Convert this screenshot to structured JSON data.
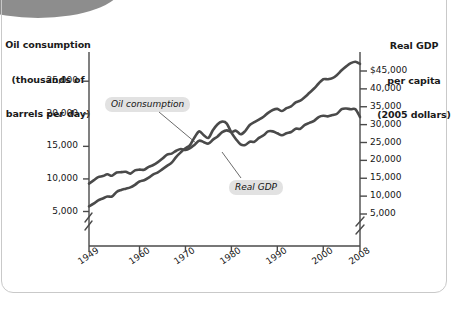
{
  "chart_data": {
    "type": "line",
    "title": "",
    "xlabel": "Year",
    "grid": false,
    "legend_position": "inline-annotations",
    "x_axis": {
      "label": "Year",
      "ticks": [
        1949,
        1960,
        1970,
        1980,
        1990,
        2000,
        2008
      ],
      "tick_labels": [
        "1949",
        "1960",
        "1970",
        "1980",
        "1990",
        "2000",
        "2008"
      ],
      "range": [
        1949,
        2008
      ]
    },
    "left_axis": {
      "title": "Oil consumption\n(thousands of\nbarrels per day)",
      "title_line1": "Oil consumption",
      "title_line2": "(thousands of",
      "title_line3": "barrels per day)",
      "ticks": [
        5000,
        10000,
        15000,
        20000,
        25000
      ],
      "tick_labels": [
        "5,000",
        "10,000",
        "15,000",
        "20,000",
        "25,000"
      ],
      "range": [
        0,
        27000
      ],
      "axis_break": true
    },
    "right_axis": {
      "title": "Real GDP\nper capita\n(2005 dollars)",
      "title_line1": "Real GDP",
      "title_line2": "per capita",
      "title_line3": "(2005 dollars)",
      "ticks": [
        5000,
        10000,
        15000,
        20000,
        25000,
        30000,
        35000,
        40000,
        45000
      ],
      "tick_labels": [
        "5,000",
        "10,000",
        "15,000",
        "20,000",
        "25,000",
        "30,000",
        "35,000",
        "40,000",
        "$45,000"
      ],
      "range": [
        0,
        48000
      ],
      "axis_break": true
    },
    "series": [
      {
        "name": "Oil consumption",
        "annotation": "Oil consumption",
        "axis": "left",
        "units": "thousands of barrels per day",
        "color": "#4a4a4a",
        "x": [
          1949,
          1950,
          1951,
          1952,
          1953,
          1954,
          1955,
          1956,
          1957,
          1958,
          1959,
          1960,
          1961,
          1962,
          1963,
          1964,
          1965,
          1966,
          1967,
          1968,
          1969,
          1970,
          1971,
          1972,
          1973,
          1974,
          1975,
          1976,
          1977,
          1978,
          1979,
          1980,
          1981,
          1982,
          1983,
          1984,
          1985,
          1986,
          1987,
          1988,
          1989,
          1990,
          1991,
          1992,
          1993,
          1994,
          1995,
          1996,
          1997,
          1998,
          1999,
          2000,
          2001,
          2002,
          2003,
          2004,
          2005,
          2006,
          2007,
          2008
        ],
        "values": [
          5800,
          6200,
          6700,
          7000,
          7300,
          7300,
          8000,
          8300,
          8500,
          8700,
          9100,
          9600,
          9800,
          10200,
          10700,
          11000,
          11500,
          12000,
          12500,
          13400,
          14100,
          14700,
          15200,
          16400,
          17300,
          16700,
          16300,
          17500,
          18400,
          18800,
          18500,
          17100,
          16100,
          15300,
          15200,
          15700,
          15700,
          16300,
          16700,
          17300,
          17300,
          17000,
          16700,
          17000,
          17200,
          17700,
          17700,
          18300,
          18600,
          18900,
          19500,
          19700,
          19600,
          19800,
          20000,
          20700,
          20800,
          20700,
          20700,
          19500
        ]
      },
      {
        "name": "Real GDP",
        "annotation": "Real GDP",
        "axis": "right",
        "units": "2005 dollars per capita",
        "color": "#4a4a4a",
        "x": [
          1949,
          1950,
          1951,
          1952,
          1953,
          1954,
          1955,
          1956,
          1957,
          1958,
          1959,
          1960,
          1961,
          1962,
          1963,
          1964,
          1965,
          1966,
          1967,
          1968,
          1969,
          1970,
          1971,
          1972,
          1973,
          1974,
          1975,
          1976,
          1977,
          1978,
          1979,
          1980,
          1981,
          1982,
          1983,
          1984,
          1985,
          1986,
          1987,
          1988,
          1989,
          1990,
          1991,
          1992,
          1993,
          1994,
          1995,
          1996,
          1997,
          1998,
          1999,
          2000,
          2001,
          2002,
          2003,
          2004,
          2005,
          2006,
          2007,
          2008
        ],
        "values": [
          13500,
          14400,
          15300,
          15600,
          16100,
          15700,
          16600,
          16700,
          16800,
          16300,
          17200,
          17400,
          17400,
          18200,
          18700,
          19500,
          20500,
          21600,
          21900,
          22700,
          23200,
          22900,
          23400,
          24400,
          25500,
          25100,
          24700,
          25800,
          26700,
          27900,
          28400,
          27900,
          28300,
          27300,
          28200,
          29900,
          30700,
          31400,
          32200,
          33300,
          34100,
          34400,
          33800,
          34600,
          35100,
          36200,
          36700,
          37700,
          38900,
          40100,
          41500,
          42700,
          42700,
          43000,
          43900,
          45200,
          46300,
          47200,
          47600,
          47000
        ]
      }
    ]
  },
  "series_labels": {
    "oil": "Oil consumption",
    "gdp": "Real GDP"
  },
  "axes": {
    "left_title_l1": "Oil consumption",
    "left_title_l2": "(thousands of",
    "left_title_l3": "barrels per day)",
    "right_title_l1": "Real GDP",
    "right_title_l2": "per capita",
    "right_title_l3": "(2005 dollars)",
    "x_title": "Year"
  },
  "left_ticks": [
    "25,000",
    "20,000",
    "15,000",
    "10,000",
    "5,000"
  ],
  "right_ticks": [
    "$45,000",
    "40,000",
    "35,000",
    "30,000",
    "25,000",
    "20,000",
    "15,000",
    "10,000",
    "5,000"
  ],
  "x_ticks": [
    "1949",
    "1960",
    "1970",
    "1980",
    "1990",
    "2000",
    "2008"
  ]
}
